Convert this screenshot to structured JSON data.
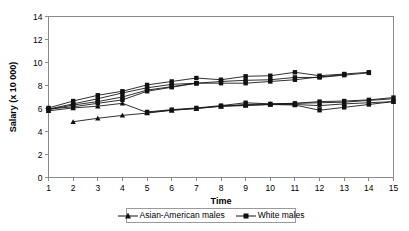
{
  "chart_data": {
    "type": "line",
    "title": "",
    "xlabel": "Time",
    "ylabel": "Salary (x 10 000)",
    "xlim": [
      1,
      15
    ],
    "ylim": [
      0,
      14
    ],
    "x_ticks": [
      1,
      2,
      3,
      4,
      5,
      6,
      7,
      8,
      9,
      10,
      11,
      12,
      13,
      14,
      15
    ],
    "y_ticks": [
      0,
      2,
      4,
      6,
      8,
      10,
      12,
      14
    ],
    "grid": false,
    "legend_position": "bottom-center",
    "marker_colors": {
      "line": "#111111",
      "axis": "#8a8a8a"
    },
    "legend": [
      {
        "label": "Asian-American males",
        "marker": "triangle"
      },
      {
        "label": "White males",
        "marker": "square"
      }
    ],
    "series": [
      {
        "name": "White males",
        "group": "White males",
        "marker": "square",
        "x": [
          1,
          2,
          3,
          4,
          5,
          6,
          7,
          8,
          9,
          10,
          11,
          12,
          13,
          14
        ],
        "values": [
          6.05,
          6.65,
          7.15,
          7.5,
          8.05,
          8.35,
          8.65,
          8.5,
          8.8,
          8.85,
          9.15,
          8.85,
          9.0,
          9.15
        ]
      },
      {
        "name": "White males 2",
        "group": "White males",
        "marker": "square",
        "x": [
          1,
          2,
          3,
          4,
          5,
          6,
          7,
          8,
          9,
          10,
          11,
          12,
          13,
          14
        ],
        "values": [
          5.95,
          6.4,
          6.85,
          7.35,
          7.8,
          8.1,
          8.2,
          8.35,
          8.45,
          8.5,
          8.7,
          8.7,
          8.9,
          9.1
        ]
      },
      {
        "name": "White males 3",
        "group": "White males",
        "marker": "square",
        "x": [
          1,
          2,
          3,
          4,
          5,
          6,
          7,
          8,
          9,
          10,
          11,
          12,
          13
        ],
        "values": [
          5.9,
          6.3,
          6.6,
          7.0,
          7.6,
          7.9,
          8.2,
          8.2,
          8.2,
          8.35,
          8.5,
          8.75,
          8.95
        ]
      },
      {
        "name": "White males 4",
        "group": "White males",
        "marker": "square",
        "x": [
          1,
          2,
          3,
          4,
          5,
          6,
          7
        ],
        "values": [
          5.95,
          6.15,
          6.45,
          6.75,
          7.5,
          7.85,
          8.2
        ]
      },
      {
        "name": "Asian-American males",
        "group": "Asian-American males",
        "marker": "triangle",
        "x": [
          1,
          2,
          3,
          4,
          5,
          6,
          7,
          8,
          9,
          10,
          11,
          12,
          13,
          14,
          15
        ],
        "values": [
          5.8,
          6.05,
          6.2,
          6.45,
          5.65,
          5.85,
          6.0,
          6.2,
          6.35,
          6.4,
          6.45,
          6.5,
          6.55,
          6.7,
          6.85
        ]
      },
      {
        "name": "Asian-American males 2",
        "group": "Asian-American males",
        "marker": "triangle",
        "x": [
          2,
          3,
          4,
          5,
          6,
          7,
          8,
          9,
          10,
          11,
          12,
          13,
          14,
          15
        ],
        "values": [
          4.85,
          5.15,
          5.4,
          5.6,
          5.85,
          6.0,
          6.2,
          6.25,
          6.35,
          6.35,
          6.25,
          6.4,
          6.5,
          6.6
        ]
      },
      {
        "name": "Mixed lower 3",
        "group": "White males",
        "marker": "square",
        "x": [
          5,
          6,
          7,
          8,
          9,
          10,
          11,
          12,
          13,
          14,
          15
        ],
        "values": [
          5.7,
          5.9,
          6.05,
          6.25,
          6.5,
          6.4,
          6.45,
          6.6,
          6.65,
          6.75,
          6.95
        ]
      },
      {
        "name": "Mixed lower 4",
        "group": "White males",
        "marker": "square",
        "x": [
          8,
          9,
          10,
          11,
          12,
          13,
          14,
          15
        ],
        "values": [
          6.2,
          6.3,
          6.35,
          6.3,
          5.85,
          6.1,
          6.35,
          6.6
        ]
      }
    ]
  },
  "axis": {
    "ylabel": "Salary (x 10 000)",
    "xlabel": "Time"
  }
}
